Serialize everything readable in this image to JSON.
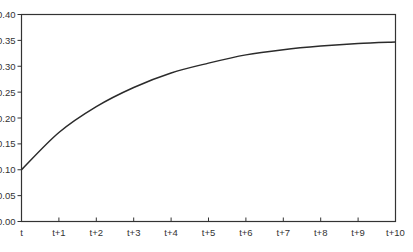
{
  "chart_data": {
    "type": "line",
    "title": "",
    "xlabel": "",
    "ylabel": "",
    "categories": [
      "t",
      "t+1",
      "t+2",
      "t+3",
      "t+4",
      "t+5",
      "t+6",
      "t+7",
      "t+8",
      "t+9",
      "t+10"
    ],
    "series": [
      {
        "name": "value",
        "values": [
          0.1,
          0.172,
          0.222,
          0.259,
          0.287,
          0.306,
          0.322,
          0.332,
          0.339,
          0.344,
          0.347
        ]
      }
    ],
    "ylim": [
      0.0,
      0.4
    ],
    "yticks": [
      "0.00",
      "0.05",
      "0.10",
      "0.15",
      "0.20",
      "0.25",
      "0.30",
      "0.35",
      "0.40"
    ],
    "grid": false,
    "legend": null,
    "colors": {
      "line": "#2b2b2b",
      "axis": "#333333",
      "background": "#ffffff"
    }
  }
}
